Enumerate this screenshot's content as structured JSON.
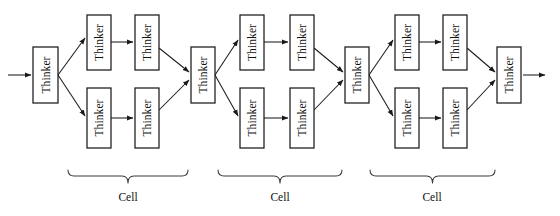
{
  "diagram": {
    "type": "block-flow-diagram",
    "node_label": "Thinker",
    "group_label": "Cell",
    "colors": {
      "box_stroke": "#1a1a1a",
      "box_fill": "#ffffff",
      "edge": "#1a1a1a",
      "brace": "#3a3a3a",
      "text": "#111111",
      "background": "#ffffff"
    },
    "text_orientation": "vertical-bottom-to-top",
    "input_arrow": {
      "label": "",
      "x1": 8,
      "y1": 75,
      "x2": 31,
      "y2": 75
    },
    "output_arrow": {
      "label": "",
      "x1": 523,
      "y1": 75,
      "x2": 547,
      "y2": 75
    },
    "nodes": [
      {
        "id": "n0",
        "label": "Thinker",
        "x": 33,
        "y": 47,
        "w": 25,
        "h": 56,
        "role": "junction"
      },
      {
        "id": "n1a",
        "label": "Thinker",
        "x": 87,
        "y": 15,
        "w": 24,
        "h": 55,
        "role": "branch-upper-1"
      },
      {
        "id": "n1b",
        "label": "Thinker",
        "x": 135,
        "y": 15,
        "w": 24,
        "h": 55,
        "role": "branch-upper-2"
      },
      {
        "id": "n1c",
        "label": "Thinker",
        "x": 87,
        "y": 88,
        "w": 24,
        "h": 60,
        "role": "branch-lower-1"
      },
      {
        "id": "n1d",
        "label": "Thinker",
        "x": 135,
        "y": 88,
        "w": 24,
        "h": 60,
        "role": "branch-lower-2"
      },
      {
        "id": "n2",
        "label": "Thinker",
        "x": 191,
        "y": 47,
        "w": 24,
        "h": 56,
        "role": "junction"
      },
      {
        "id": "n3a",
        "label": "Thinker",
        "x": 240,
        "y": 15,
        "w": 24,
        "h": 55,
        "role": "branch-upper-1"
      },
      {
        "id": "n3b",
        "label": "Thinker",
        "x": 290,
        "y": 15,
        "w": 24,
        "h": 55,
        "role": "branch-upper-2"
      },
      {
        "id": "n3c",
        "label": "Thinker",
        "x": 240,
        "y": 88,
        "w": 24,
        "h": 60,
        "role": "branch-lower-1"
      },
      {
        "id": "n3d",
        "label": "Thinker",
        "x": 290,
        "y": 88,
        "w": 24,
        "h": 60,
        "role": "branch-lower-2"
      },
      {
        "id": "n4",
        "label": "Thinker",
        "x": 345,
        "y": 47,
        "w": 24,
        "h": 56,
        "role": "junction"
      },
      {
        "id": "n5a",
        "label": "Thinker",
        "x": 395,
        "y": 15,
        "w": 24,
        "h": 55,
        "role": "branch-upper-1"
      },
      {
        "id": "n5b",
        "label": "Thinker",
        "x": 443,
        "y": 15,
        "w": 24,
        "h": 55,
        "role": "branch-upper-2"
      },
      {
        "id": "n5c",
        "label": "Thinker",
        "x": 395,
        "y": 88,
        "w": 24,
        "h": 60,
        "role": "branch-lower-1"
      },
      {
        "id": "n5d",
        "label": "Thinker",
        "x": 443,
        "y": 88,
        "w": 24,
        "h": 60,
        "role": "branch-lower-2"
      },
      {
        "id": "n6",
        "label": "Thinker",
        "x": 497,
        "y": 47,
        "w": 24,
        "h": 56,
        "role": "sink"
      }
    ],
    "edges": [
      {
        "from": "input",
        "to": "n0",
        "x1": 8,
        "y1": 75,
        "x2": 31,
        "y2": 75
      },
      {
        "from": "n0",
        "to": "n1a",
        "x1": 58,
        "y1": 75,
        "x2": 85,
        "y2": 38
      },
      {
        "from": "n0",
        "to": "n1c",
        "x1": 58,
        "y1": 75,
        "x2": 85,
        "y2": 116
      },
      {
        "from": "n1a",
        "to": "n1b",
        "x1": 111,
        "y1": 42,
        "x2": 133,
        "y2": 42
      },
      {
        "from": "n1c",
        "to": "n1d",
        "x1": 111,
        "y1": 118,
        "x2": 133,
        "y2": 118
      },
      {
        "from": "n1b",
        "to": "n2",
        "x1": 159,
        "y1": 48,
        "x2": 189,
        "y2": 72
      },
      {
        "from": "n1d",
        "to": "n2",
        "x1": 159,
        "y1": 110,
        "x2": 189,
        "y2": 80
      },
      {
        "from": "n2",
        "to": "n3a",
        "x1": 215,
        "y1": 75,
        "x2": 238,
        "y2": 40
      },
      {
        "from": "n2",
        "to": "n3c",
        "x1": 215,
        "y1": 75,
        "x2": 238,
        "y2": 116
      },
      {
        "from": "n3a",
        "to": "n3b",
        "x1": 264,
        "y1": 42,
        "x2": 288,
        "y2": 42
      },
      {
        "from": "n3c",
        "to": "n3d",
        "x1": 264,
        "y1": 118,
        "x2": 288,
        "y2": 118
      },
      {
        "from": "n3b",
        "to": "n4",
        "x1": 314,
        "y1": 48,
        "x2": 343,
        "y2": 72
      },
      {
        "from": "n3d",
        "to": "n4",
        "x1": 314,
        "y1": 110,
        "x2": 343,
        "y2": 80
      },
      {
        "from": "n4",
        "to": "n5a",
        "x1": 369,
        "y1": 75,
        "x2": 393,
        "y2": 40
      },
      {
        "from": "n4",
        "to": "n5c",
        "x1": 369,
        "y1": 75,
        "x2": 393,
        "y2": 116
      },
      {
        "from": "n5a",
        "to": "n5b",
        "x1": 419,
        "y1": 42,
        "x2": 441,
        "y2": 42
      },
      {
        "from": "n5c",
        "to": "n5d",
        "x1": 419,
        "y1": 118,
        "x2": 441,
        "y2": 118
      },
      {
        "from": "n5b",
        "to": "n6",
        "x1": 467,
        "y1": 48,
        "x2": 495,
        "y2": 72
      },
      {
        "from": "n5d",
        "to": "n6",
        "x1": 467,
        "y1": 110,
        "x2": 495,
        "y2": 80
      },
      {
        "from": "n6",
        "to": "output",
        "x1": 523,
        "y1": 75,
        "x2": 545,
        "y2": 75
      }
    ],
    "groups": [
      {
        "id": "cell1",
        "label": "Cell",
        "left": 68,
        "right": 188,
        "y": 176,
        "label_x": 128,
        "label_y": 201
      },
      {
        "id": "cell2",
        "label": "Cell",
        "left": 218,
        "right": 342,
        "y": 176,
        "label_x": 280,
        "label_y": 201
      },
      {
        "id": "cell3",
        "label": "Cell",
        "left": 370,
        "right": 495,
        "y": 176,
        "label_x": 432,
        "label_y": 201
      }
    ]
  }
}
